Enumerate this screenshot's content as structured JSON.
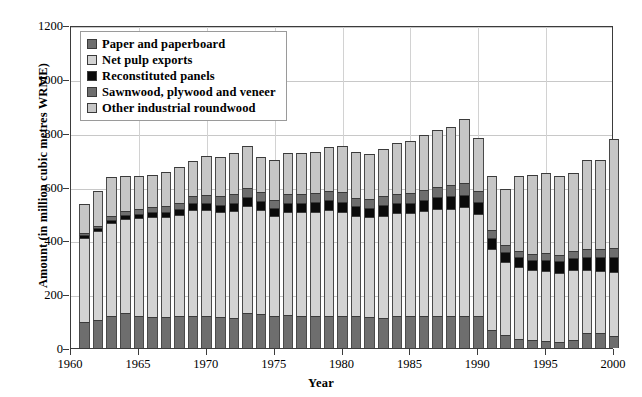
{
  "chart_data": {
    "type": "bar",
    "subtype": "stacked-column",
    "title": "",
    "xlabel": "Year",
    "ylabel": "Amount (in million cubic metres WRME)",
    "xlim": [
      1960,
      2000
    ],
    "ylim": [
      0,
      1200
    ],
    "ytick_values": [
      0,
      200,
      400,
      600,
      800,
      1000,
      1200
    ],
    "ytick_labels": [
      "0",
      "200",
      "400",
      "600",
      "800",
      "1000",
      "1200"
    ],
    "xtick_values": [
      1960,
      1965,
      1970,
      1975,
      1980,
      1985,
      1990,
      1995,
      2000
    ],
    "xtick_labels": [
      "1960",
      "1965",
      "1970",
      "1975",
      "1980",
      "1985",
      "1990",
      "1995",
      "2000"
    ],
    "grid": "horizontal-and-vertical",
    "legend_position": "upper-left-inside",
    "stack_order_bottom_to_top": [
      "Other industrial roundwood",
      "Sawnwood, plywood and veneer",
      "Reconstituted panels",
      "Net pulp exports",
      "Paper and paperboard"
    ],
    "categories": [
      1961,
      1962,
      1963,
      1964,
      1965,
      1966,
      1967,
      1968,
      1969,
      1970,
      1971,
      1972,
      1973,
      1974,
      1975,
      1976,
      1977,
      1978,
      1979,
      1980,
      1981,
      1982,
      1983,
      1984,
      1985,
      1986,
      1987,
      1988,
      1989,
      1990,
      1991,
      1992,
      1993,
      1994,
      1995,
      1996,
      1997,
      1998,
      1999,
      2000
    ],
    "series": [
      {
        "name": "Other industrial roundwood",
        "color": "#c6c6c6",
        "values": [
          95,
          105,
          120,
          130,
          118,
          115,
          115,
          118,
          120,
          120,
          115,
          112,
          130,
          125,
          118,
          122,
          120,
          120,
          118,
          118,
          118,
          115,
          112,
          118,
          118,
          118,
          118,
          118,
          120,
          118,
          68,
          50,
          32,
          30,
          25,
          22,
          28,
          55,
          55,
          45
        ]
      },
      {
        "name": "Sawnwood, plywood and veneer",
        "color": "#6e6e6e",
        "values": [
          315,
          330,
          345,
          350,
          365,
          372,
          372,
          375,
          392,
          392,
          390,
          398,
          398,
          388,
          372,
          385,
          385,
          385,
          395,
          388,
          372,
          370,
          380,
          382,
          382,
          390,
          398,
          400,
          402,
          378,
          300,
          270,
          268,
          258,
          262,
          258,
          262,
          235,
          230,
          238
        ]
      },
      {
        "name": "Reconstituted panels",
        "color": "#0a0a0a",
        "values": [
          8,
          10,
          12,
          14,
          16,
          18,
          20,
          22,
          25,
          28,
          28,
          30,
          32,
          32,
          30,
          32,
          34,
          36,
          38,
          38,
          36,
          36,
          38,
          38,
          40,
          42,
          44,
          46,
          48,
          46,
          40,
          38,
          38,
          38,
          40,
          42,
          44,
          48,
          52,
          55
        ]
      },
      {
        "name": "Net pulp exports",
        "color": "#d3d3d3",
        "values": [
          8,
          10,
          12,
          14,
          18,
          20,
          22,
          24,
          26,
          28,
          30,
          32,
          34,
          34,
          30,
          32,
          32,
          34,
          34,
          34,
          32,
          32,
          34,
          34,
          36,
          38,
          38,
          40,
          42,
          42,
          30,
          26,
          24,
          24,
          26,
          24,
          26,
          28,
          30,
          32
        ]
      },
      {
        "name": "Paper and paperboard",
        "color": "#6e6e6e",
        "values": [
          108,
          130,
          146,
          132,
          122,
          118,
          126,
          132,
          132,
          147,
          147,
          153,
          156,
          130,
          150,
          154,
          154,
          155,
          160,
          172,
          172,
          167,
          176,
          188,
          192,
          202,
          212,
          216,
          238,
          196,
          202,
          206,
          278,
          294,
          297,
          294,
          290,
          334,
          333,
          405
        ]
      }
    ],
    "totals": [
      534,
      585,
      635,
      640,
      639,
      643,
      655,
      671,
      695,
      715,
      710,
      725,
      750,
      709,
      700,
      725,
      725,
      730,
      745,
      750,
      730,
      720,
      740,
      760,
      768,
      790,
      810,
      820,
      850,
      780,
      640,
      590,
      640,
      644,
      650,
      640,
      650,
      700,
      700,
      775
    ]
  },
  "legend": {
    "items": [
      {
        "label": "Paper and paperboard",
        "swatch": "#6e6e6e"
      },
      {
        "label": "Net pulp exports",
        "swatch": "#d3d3d3"
      },
      {
        "label": "Reconstituted panels",
        "swatch": "#0a0a0a"
      },
      {
        "label": "Sawnwood, plywood and veneer",
        "swatch": "#6e6e6e"
      },
      {
        "label": "Other industrial roundwood",
        "swatch": "#c6c6c6"
      }
    ]
  }
}
